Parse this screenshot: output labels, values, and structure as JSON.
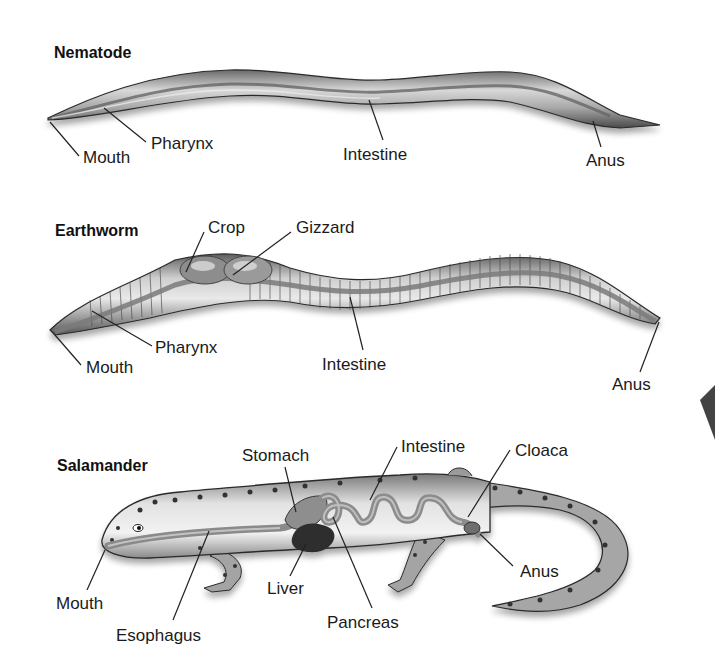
{
  "colors": {
    "background": "#ffffff",
    "text": "#1a1a1a",
    "body_fill": "#b9b9b9",
    "body_dark": "#3a3a3a",
    "gut": "#8c8c8c",
    "liver": "#2e2e2e"
  },
  "nematode": {
    "title": "Nematode",
    "labels": {
      "mouth": "Mouth",
      "pharynx": "Pharynx",
      "intestine": "Intestine",
      "anus": "Anus"
    }
  },
  "earthworm": {
    "title": "Earthworm",
    "labels": {
      "crop": "Crop",
      "gizzard": "Gizzard",
      "mouth": "Mouth",
      "pharynx": "Pharynx",
      "intestine": "Intestine",
      "anus": "Anus"
    }
  },
  "salamander": {
    "title": "Salamander",
    "labels": {
      "stomach": "Stomach",
      "intestine": "Intestine",
      "cloaca": "Cloaca",
      "mouth": "Mouth",
      "liver": "Liver",
      "anus": "Anus",
      "esophagus": "Esophagus",
      "pancreas": "Pancreas"
    }
  }
}
